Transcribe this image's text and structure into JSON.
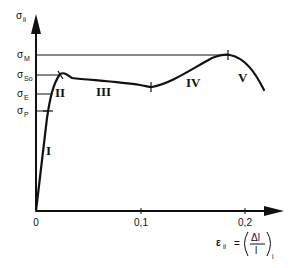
{
  "diagram": {
    "type": "stress-strain curve",
    "y_axis": {
      "symbol": "σ",
      "subscript": "ii"
    },
    "x_axis": {
      "symbol": "ε",
      "subscript": "ii",
      "equals": "=",
      "numerator": "Δl",
      "denominator": "l",
      "outer_subscript": "i",
      "ticks": [
        "0",
        "0,1",
        "0,2"
      ]
    },
    "stress_levels": [
      {
        "symbol": "σ",
        "subscript": "M"
      },
      {
        "symbol": "σ",
        "subscript": "So"
      },
      {
        "symbol": "σ",
        "subscript": "E"
      },
      {
        "symbol": "σ",
        "subscript": "P"
      }
    ],
    "regions": [
      "I",
      "II",
      "III",
      "IV",
      "V"
    ],
    "colors": {
      "line": "#111111",
      "background": "#ffffff"
    }
  }
}
